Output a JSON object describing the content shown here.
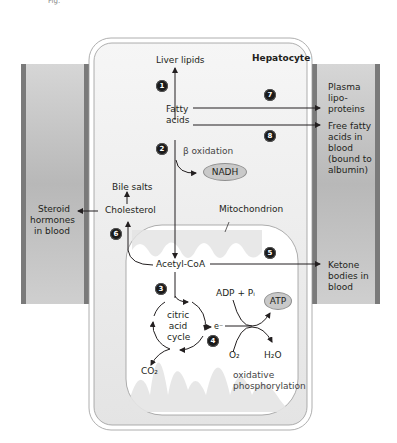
{
  "figure": {
    "top_fragment": "Fig.",
    "cell_title": "Hepatocyte",
    "organelle_title": "Mitochondrion"
  },
  "labels": {
    "liver_lipids": "Liver lipids",
    "fatty_acids_line1": "Fatty",
    "fatty_acids_line2": "acids",
    "beta_oxidation": "β oxidation",
    "nadh": "NADH",
    "bile_salts": "Bile salts",
    "cholesterol": "Cholesterol",
    "acetyl_coa": "Acetyl-CoA",
    "citric_line1": "citric",
    "citric_line2": "acid",
    "citric_line3": "cycle",
    "electron": "e⁻",
    "adp_pi": "ADP + Pᵢ",
    "atp": "ATP",
    "o2": "O₂",
    "h2o": "H₂O",
    "co2": "CO₂",
    "oxphos_line1": "oxidative",
    "oxphos_line2": "phosphorylation"
  },
  "blood_labels": {
    "steroid": [
      "Steroid",
      "hormones",
      "in blood"
    ],
    "plasma": [
      "Plasma",
      "lipo-",
      "proteins"
    ],
    "ffa": [
      "Free fatty",
      "acids in",
      "blood",
      "(bound to",
      "albumin)"
    ],
    "ketone": [
      "Ketone",
      "bodies in",
      "blood"
    ]
  },
  "steps": [
    "1",
    "2",
    "3",
    "4",
    "5",
    "6",
    "7",
    "8"
  ],
  "colors": {
    "vessel_wall": "#7a7a7a",
    "vessel_fill": "#c4c4c4",
    "cell_fill": "#ececec",
    "mito_fill": "#ffffff",
    "mito_matrix": "#dcdcdc",
    "arrow": "#231f20",
    "pill_fill": "#c9c9c9"
  }
}
